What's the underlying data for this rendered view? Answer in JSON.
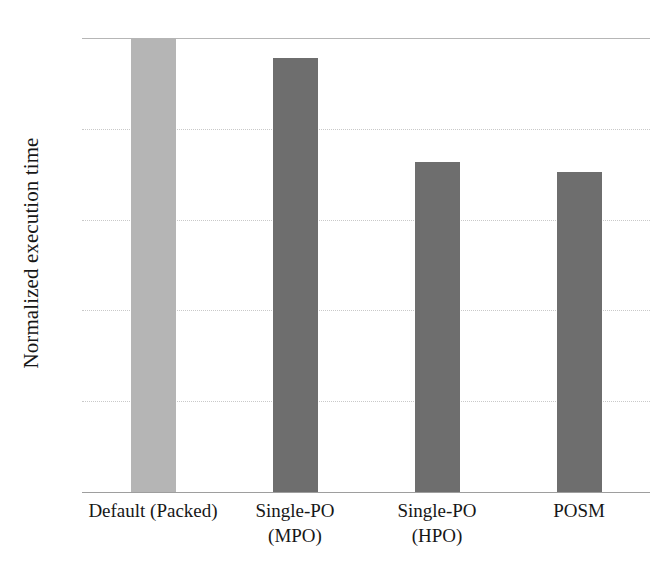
{
  "chart_data": {
    "type": "bar",
    "title": "",
    "xlabel": "",
    "ylabel": "Normalized execution time",
    "categories": [
      "Default (Packed)",
      "Single-PO (MPO)",
      "Single-PO (HPO)",
      "POSM"
    ],
    "category_lines": [
      [
        "Default (Packed)",
        ""
      ],
      [
        "Single-PO",
        "(MPO)"
      ],
      [
        "Single-PO",
        "(HPO)"
      ],
      [
        "POSM",
        ""
      ]
    ],
    "values": [
      5.0,
      4.78,
      3.63,
      3.52
    ],
    "ylim": [
      0,
      5
    ],
    "yticks": [
      0,
      1,
      2,
      3,
      4,
      5
    ],
    "ytick_labels": [
      "0",
      "1",
      "2",
      "3",
      "4",
      "5"
    ],
    "grid": true,
    "grid_axis": "y",
    "legend": false,
    "bar_colors": [
      "#b5b5b5",
      "#6e6e6e",
      "#6e6e6e",
      "#6e6e6e"
    ],
    "colors": {
      "bar_light": "#b5b5b5",
      "bar_dark": "#6e6e6e",
      "gridline": "#c9c9c9",
      "axis": "#9e9e9e",
      "text": "#171717",
      "background": "#ffffff"
    }
  }
}
